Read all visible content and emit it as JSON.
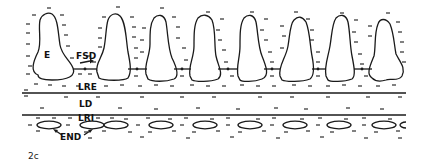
{
  "figure": {
    "panel_label": "2c",
    "labels": {
      "enterocyte": "E",
      "fsd": "FSD",
      "lre": "LRE",
      "ld": "LD",
      "lri": "LRI",
      "end": "END"
    },
    "colors": {
      "ink": "#1a1a1a",
      "background": "#ffffff"
    },
    "villus_count": 8,
    "ellipse_count": 10
  }
}
